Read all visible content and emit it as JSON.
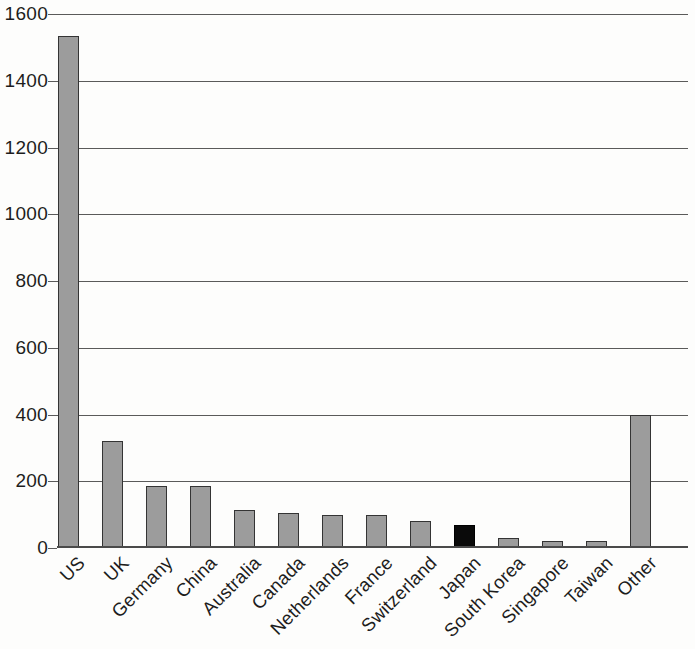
{
  "chart_data": {
    "type": "bar",
    "title": "",
    "subtitle": "",
    "xlabel": "",
    "ylabel": "",
    "categories": [
      "US",
      "UK",
      "Germany",
      "China",
      "Australia",
      "Canada",
      "Netherlands",
      "France",
      "Switzerland",
      "Japan",
      "South Korea",
      "Singapore",
      "Taiwan",
      "Other"
    ],
    "values": [
      1535,
      320,
      185,
      185,
      115,
      105,
      100,
      100,
      80,
      70,
      30,
      22,
      22,
      400
    ],
    "highlight_category": "Japan",
    "highlight_index": 9,
    "ylim": [
      0,
      1600
    ],
    "ytick_values": [
      0,
      200,
      400,
      600,
      800,
      1000,
      1200,
      1400,
      1600
    ],
    "ytick_labels": [
      "0",
      "200",
      "400",
      "600",
      "800",
      "1000",
      "1200",
      "1400",
      "1600"
    ],
    "grid": true,
    "grid_axis": "y",
    "legend": false,
    "legend_position": "none",
    "annotations": [],
    "colors": {
      "bar_fill": "#9c9c9c",
      "bar_stroke": "#343434",
      "highlight_fill": "#0a0a0a",
      "gridline": "#5a5a5a",
      "axis": "#4a4a4a",
      "text": "#1d1d1d",
      "background": "#fdfdfc"
    }
  }
}
